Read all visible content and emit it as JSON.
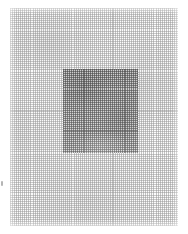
{
  "image": {
    "kind": "grid-mesh-texture",
    "width": 188,
    "height": 234,
    "background_color": "#ffffff",
    "description": "Fine woven grid texture on white with a darker square patch near the center"
  },
  "outer_mesh": {
    "name": "outer-grid",
    "left": 10,
    "top": 8,
    "width": 168,
    "height": 218,
    "cell_pitch_px": 2,
    "line_color": "#969696",
    "fill_color": "#fcfcfc"
  },
  "inner_square": {
    "name": "inner-dark-grid-square",
    "left": 63,
    "top": 69,
    "width": 75,
    "height": 84,
    "cell_pitch_px": 2,
    "line_color": "#464646",
    "fill_color": "#d8d8d8"
  },
  "edge_mark": {
    "name": "left-edge-speck",
    "left": 1,
    "top": 181,
    "width": 2,
    "height": 5,
    "color": "#787878"
  }
}
